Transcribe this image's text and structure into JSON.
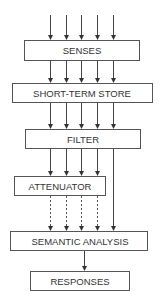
{
  "diagram": {
    "nodes": [
      {
        "id": "senses",
        "label": "SENSES"
      },
      {
        "id": "sts",
        "label": "SHORT-TERM STORE"
      },
      {
        "id": "filter",
        "label": "FILTER"
      },
      {
        "id": "attenuator",
        "label": "ATTENUATOR"
      },
      {
        "id": "semantic",
        "label": "SEMANTIC ANALYSIS"
      },
      {
        "id": "responses",
        "label": "RESPONSES"
      }
    ],
    "edges": [
      {
        "from": "input",
        "to": "senses",
        "count": 5,
        "style": "solid"
      },
      {
        "from": "senses",
        "to": "sts",
        "count": 5,
        "style": "solid"
      },
      {
        "from": "sts",
        "to": "filter",
        "count": 5,
        "style": "solid"
      },
      {
        "from": "filter",
        "to": "attenuator",
        "count": 4,
        "style": "solid"
      },
      {
        "from": "filter",
        "to": "semantic",
        "count": 1,
        "style": "solid",
        "note": "bypasses attenuator"
      },
      {
        "from": "attenuator",
        "to": "semantic",
        "count": 4,
        "style": "dashed"
      },
      {
        "from": "semantic",
        "to": "responses",
        "count": 1,
        "style": "solid"
      }
    ]
  }
}
